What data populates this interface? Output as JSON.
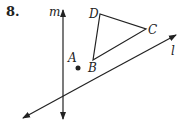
{
  "problem": {
    "number": "8.",
    "labels": {
      "m": "m",
      "l": "l",
      "A": "A",
      "B": "B",
      "C": "C",
      "D": "D"
    }
  },
  "diagram": {
    "line_m": {
      "x1": 63,
      "y1": 118,
      "x2": 63,
      "y2": 11,
      "arrows": "both"
    },
    "line_l": {
      "x1": 23,
      "y1": 118,
      "x2": 176,
      "y2": 35,
      "arrows": "both"
    },
    "triangle": {
      "B": [
        93,
        60
      ],
      "C": [
        146,
        29
      ],
      "D": [
        100,
        14
      ]
    },
    "point_A": [
      78,
      68
    ],
    "color": "#222222"
  }
}
